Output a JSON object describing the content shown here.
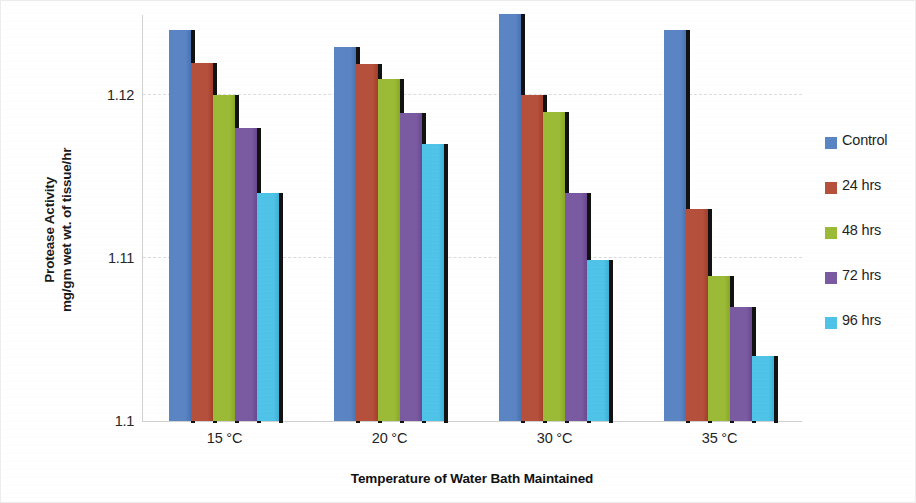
{
  "chart_data": {
    "type": "bar",
    "title": "",
    "xlabel": "Temperature of Water Bath Maintained",
    "ylabel": "Protease Activity\nmg/gm wet wt. of tissue/hr",
    "categories": [
      "15 °C",
      "20 °C",
      "30 °C",
      "35 °C"
    ],
    "ylim": [
      1.1,
      1.125
    ],
    "yticks": [
      "1.1",
      "1.11",
      "1.12"
    ],
    "ytick_values": [
      1.1,
      1.11,
      1.12
    ],
    "grid": true,
    "legend_position": "right",
    "series": [
      {
        "name": "Control",
        "color": "#5B84C4",
        "values": [
          1.124,
          1.123,
          1.125,
          1.124
        ]
      },
      {
        "name": "24 hrs",
        "color": "#B5503C",
        "values": [
          1.122,
          1.1219,
          1.12,
          1.113
        ]
      },
      {
        "name": "48 hrs",
        "color": "#9BBB37",
        "values": [
          1.12,
          1.121,
          1.119,
          1.1089
        ]
      },
      {
        "name": "72 hrs",
        "color": "#7A5AA0",
        "values": [
          1.118,
          1.1189,
          1.114,
          1.107
        ]
      },
      {
        "name": "96 hrs",
        "color": "#4FC3E8",
        "values": [
          1.114,
          1.117,
          1.1099,
          1.104
        ]
      }
    ]
  },
  "legend": {
    "items": [
      {
        "label": "Control"
      },
      {
        "label": "24 hrs"
      },
      {
        "label": "48 hrs"
      },
      {
        "label": "72 hrs"
      },
      {
        "label": "96 hrs"
      }
    ]
  },
  "axes": {
    "y_title": "Protease Activity\nmg/gm wet wt. of tissue/hr",
    "x_title": "Temperature of Water Bath Maintained"
  }
}
